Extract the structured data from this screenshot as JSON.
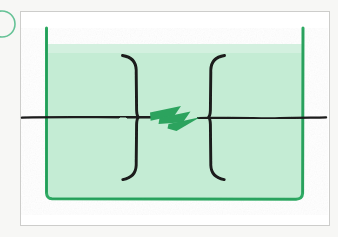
{
  "figure": {
    "title": "Spark gap between two electrodes immersed in liquid",
    "style": "hand-drawn ink and marker sketch",
    "caption": "",
    "background_color": "#f7f7f5"
  },
  "card": {
    "name": "white drawing card",
    "fill_color": "#ffffff",
    "border_color": "#cdcdcb",
    "x": 20,
    "y": 11,
    "width": 310,
    "height": 215
  },
  "corner_mark": {
    "name": "partial circle annotation at left edge",
    "color": "#4bb985",
    "center_x": 2,
    "center_y": 24,
    "radius": 13,
    "label": ""
  },
  "vessel": {
    "name": "beaker / container",
    "wall_color": "#2eaa63",
    "liquid_fill_color": "#c4ecd4",
    "left_wall_x": 46,
    "right_wall_x": 303,
    "top_y": 28,
    "bottom_y": 200,
    "liquid_level_y": 44,
    "wall_stroke_width": 3
  },
  "electrodes": [
    {
      "name": "left electrode",
      "glyph": "}",
      "orientation": "opens-left",
      "color": "#1a1a1a",
      "spine_x": 136,
      "top_y": 55,
      "bottom_y": 180,
      "stroke_width": 3
    },
    {
      "name": "right electrode",
      "glyph": "{",
      "orientation": "opens-right",
      "color": "#1a1a1a",
      "spine_x": 211,
      "top_y": 55,
      "bottom_y": 180,
      "stroke_width": 3
    }
  ],
  "spark": {
    "name": "lightning bolt / discharge arc",
    "color": "#2ca35e",
    "x": 150,
    "y": 104,
    "width": 50,
    "height": 27,
    "label": ""
  },
  "circuit_line": {
    "name": "horizontal conductor wire",
    "color": "#1a1a1a",
    "y": 117,
    "x_start": 22,
    "x_end": 326,
    "stroke_width": 2.4
  },
  "colors": {
    "ink_black": "#1a1a1a",
    "marker_green": "#2eaa63",
    "spark_green": "#2ca35e",
    "liquid_mint": "#c4ecd4",
    "card_white": "#ffffff",
    "card_border": "#cdcdcb",
    "page_gray": "#f7f7f5"
  },
  "labels": {
    "none_visible": ""
  }
}
